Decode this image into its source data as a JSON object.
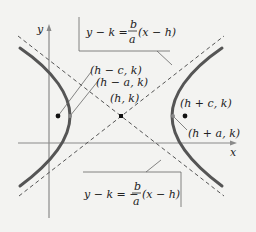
{
  "diagram": {
    "type": "hyperbola-horizontal-transverse-axis",
    "axes": {
      "x_label": "x",
      "y_label": "y"
    },
    "center_label": "(h, k)",
    "foci_labels": [
      "(h − c, k)",
      "(h + c, k)"
    ],
    "vertex_labels": [
      "(h − a, k)",
      "(h + a, k)"
    ],
    "asymptote_upper": {
      "lhs": "y − k =",
      "num": "b",
      "den": "a",
      "rhs": "(x − h)"
    },
    "asymptote_lower": {
      "lhs": "y − k = −",
      "num": "b",
      "den": "a",
      "rhs": "(x − h)"
    },
    "colors": {
      "background": "#f3f3f1",
      "curve": "#555555",
      "axis": "#8a8a8a",
      "asymptote": "#555555",
      "text": "#222222"
    }
  }
}
